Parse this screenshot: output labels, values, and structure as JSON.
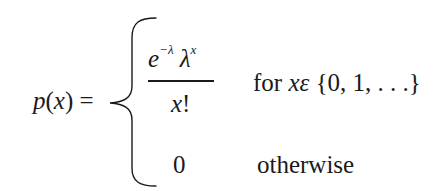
{
  "formula": {
    "lhs": {
      "func": "p",
      "arg_open": "(",
      "arg": "x",
      "arg_close": ")",
      "equals": " ="
    },
    "case1": {
      "numerator": {
        "base1": "e",
        "exp1": "−λ",
        "base2": " λ",
        "exp2": "x"
      },
      "denominator": {
        "var": "x",
        "bang": "!"
      },
      "condition": {
        "word": "for ",
        "var": "x",
        "elem": "ε",
        "set": " {0, 1, . . .}"
      }
    },
    "case2": {
      "value": "0",
      "condition": "otherwise"
    }
  },
  "colors": {
    "text": "#1a1a1a",
    "background": "#ffffff"
  }
}
